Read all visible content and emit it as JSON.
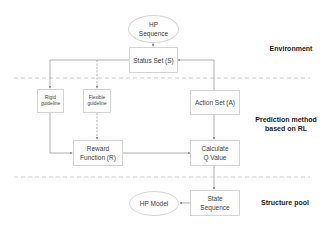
{
  "nodes": {
    "hp_sequence": {
      "line1": "HP",
      "line2": "Sequence"
    },
    "status_set": {
      "label": "Status Set (S)"
    },
    "rigid_guideline": {
      "line1": "Rigid",
      "line2": "guideline"
    },
    "flexible_guideline": {
      "line1": "Flexible",
      "line2": "guideline"
    },
    "action_set": {
      "label": "Action Set (A)"
    },
    "reward_function": {
      "line1": "Reward",
      "line2": "Function (R)"
    },
    "calculate_q": {
      "line1": "Calculate",
      "line2": "Q Value"
    },
    "state_sequence": {
      "line1": "State",
      "line2": "Sequence"
    },
    "hp_model": {
      "label": "HP Model"
    }
  },
  "regions": {
    "environment": "Environment",
    "prediction_line1": "Prediction method",
    "prediction_line2": "based on RL",
    "structure_pool": "Structure pool"
  },
  "colors": {
    "line": "#8c8c8c",
    "divider": "#bfbfbf",
    "box_border": "#d4d4d4"
  }
}
